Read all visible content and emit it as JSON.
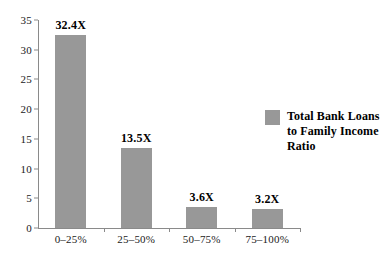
{
  "chart_data": {
    "type": "bar",
    "title": "",
    "subtitle": "",
    "xlabel": "",
    "ylabel": "",
    "categories": [
      "0–25%",
      "25–50%",
      "50–75%",
      "75–100%"
    ],
    "values": [
      32.4,
      13.5,
      3.6,
      3.2
    ],
    "data_labels": [
      "32.4X",
      "13.5X",
      "3.6X",
      "3.2X"
    ],
    "series": [
      {
        "name": "Total Bank Loans to Family Income Ratio",
        "values": [
          32.4,
          13.5,
          3.6,
          3.2
        ],
        "color": "#989898"
      }
    ],
    "ylim": [
      0,
      35
    ],
    "y_ticks": [
      0,
      5,
      10,
      15,
      20,
      25,
      30,
      35
    ],
    "y_tick_labels": [
      "0",
      "5",
      "10",
      "15",
      "20",
      "25",
      "30",
      "35"
    ],
    "grid": false,
    "legend_position": "right",
    "legend": [
      {
        "label": "Total Bank Loans to Family Income Ratio",
        "color": "#989898"
      }
    ]
  },
  "legend": {
    "label_line_1": "Total Bank Loans",
    "label_line_2": "to Family Income",
    "label_line_3": "Ratio",
    "swatch_color": "#989898"
  },
  "axis": {
    "axis_color": "#8a8a8a",
    "text_color": "#1a1a1a"
  }
}
